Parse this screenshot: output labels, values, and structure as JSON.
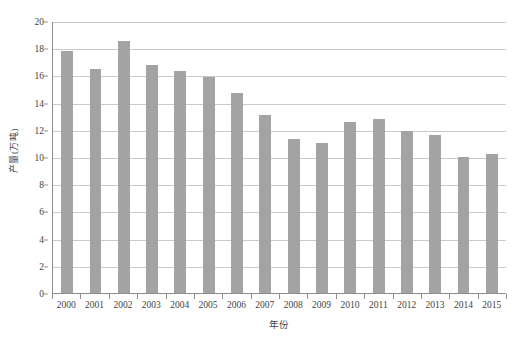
{
  "chart_data": {
    "type": "bar",
    "title": "",
    "subtitle": "",
    "xlabel": "年份",
    "ylabel": "产量(万吨)",
    "categories": [
      "2000",
      "2001",
      "2002",
      "2003",
      "2004",
      "2005",
      "2006",
      "2007",
      "2008",
      "2009",
      "2010",
      "2011",
      "2012",
      "2013",
      "2014",
      "2015"
    ],
    "values": [
      17.8,
      16.5,
      18.5,
      16.8,
      16.3,
      15.9,
      14.7,
      13.1,
      11.3,
      11.0,
      12.6,
      12.8,
      11.9,
      11.6,
      10.0,
      10.2
    ],
    "series": [
      {
        "name": "产量",
        "values": [
          17.8,
          16.5,
          18.5,
          16.8,
          16.3,
          15.9,
          14.7,
          13.1,
          11.3,
          11.0,
          12.6,
          12.8,
          11.9,
          11.6,
          10.0,
          10.2
        ]
      }
    ],
    "ylim": [
      0,
      20
    ],
    "ytick_step": 2,
    "yticks": [
      "20",
      "18",
      "16",
      "14",
      "12",
      "10",
      "8",
      "6",
      "4",
      "2",
      "0"
    ],
    "ytick_values": [
      20,
      18,
      16,
      14,
      12,
      10,
      8,
      6,
      4,
      2,
      0
    ],
    "grid": true,
    "grid_axis": "y",
    "legend": false,
    "legend_position": "none",
    "bar_color": "#a3a3a3",
    "gridline_color": "#c9c9c9",
    "axis_color": "#8d8d8d",
    "background": "#ffffff"
  }
}
